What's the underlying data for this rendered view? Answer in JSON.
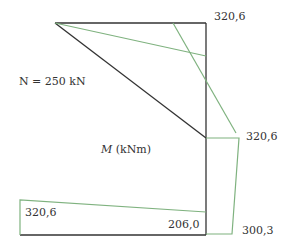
{
  "diagram": {
    "type": "bending-moment-diagram",
    "colors": {
      "structure": "#333333",
      "moment": "#7fb27f"
    },
    "labels": {
      "axial_force": "N = 250 kN",
      "moment_symbol": "M",
      "moment_unit": " (kNm)",
      "top_right": "320,6",
      "mid_right": "320,6",
      "bottom_left": "320,6",
      "bottom_inner": "206,0",
      "bottom_right": "300,3"
    }
  }
}
